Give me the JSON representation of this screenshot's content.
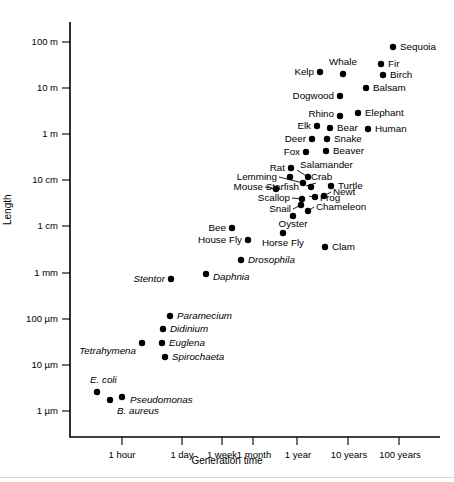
{
  "chart_data": {
    "type": "scatter",
    "title": "",
    "xlabel": "Generation time",
    "ylabel": "Length",
    "xscale": "log",
    "yscale": "log",
    "grid": false,
    "legend": "none",
    "x_tick_labels": [
      "1 hour",
      "1 day",
      "1 week",
      "1 month",
      "1 year",
      "10 years",
      "100 years"
    ],
    "y_tick_labels": [
      "100 m",
      "10 m",
      "1 m",
      "10 cm",
      "1 cm",
      "1 mm",
      "100 µm",
      "10 µm",
      "1 µm"
    ],
    "points": [
      {
        "label": "Sequoia",
        "generation_time": "100 years",
        "length": "100 m",
        "italic": false,
        "side": "right"
      },
      {
        "label": "Fir",
        "generation_time": "60 years",
        "length": "30 m",
        "italic": false,
        "side": "right"
      },
      {
        "label": "Birch",
        "generation_time": "60 years",
        "length": "20 m",
        "italic": false,
        "side": "right"
      },
      {
        "label": "Balsam",
        "generation_time": "30 years",
        "length": "12 m",
        "italic": false,
        "side": "right"
      },
      {
        "label": "Whale",
        "generation_time": "12 years",
        "length": "20 m",
        "italic": false,
        "side": "above"
      },
      {
        "label": "Kelp",
        "generation_time": "8 years",
        "length": "20 m",
        "italic": false,
        "side": "left"
      },
      {
        "label": "Dogwood",
        "generation_time": "12 years",
        "length": "8 m",
        "italic": false,
        "side": "left"
      },
      {
        "label": "Elephant",
        "generation_time": "20 years",
        "length": "3 m",
        "italic": false,
        "side": "right"
      },
      {
        "label": "Rhino",
        "generation_time": "12 years",
        "length": "3 m",
        "italic": false,
        "side": "left"
      },
      {
        "label": "Human",
        "generation_time": "25 years",
        "length": "1.8 m",
        "italic": false,
        "side": "right"
      },
      {
        "label": "Bear",
        "generation_time": "8 years",
        "length": "1.8 m",
        "italic": false,
        "side": "right"
      },
      {
        "label": "Elk",
        "generation_time": "6 years",
        "length": "1.8 m",
        "italic": false,
        "side": "left"
      },
      {
        "label": "Snake",
        "generation_time": "7 years",
        "length": "1.2 m",
        "italic": false,
        "side": "right"
      },
      {
        "label": "Deer",
        "generation_time": "5 years",
        "length": "1.2 m",
        "italic": false,
        "side": "left"
      },
      {
        "label": "Beaver",
        "generation_time": "6 years",
        "length": "0.8 m",
        "italic": false,
        "side": "right"
      },
      {
        "label": "Fox",
        "generation_time": "3.5 years",
        "length": "0.7 m",
        "italic": false,
        "side": "left"
      },
      {
        "label": "Salamander",
        "generation_time": "5 years",
        "length": "25 cm",
        "italic": false,
        "side": "right"
      },
      {
        "label": "Rat",
        "generation_time": "2.5 years",
        "length": "25 cm",
        "italic": false,
        "side": "left"
      },
      {
        "label": "Crab",
        "generation_time": "5 years",
        "length": "16 cm",
        "italic": false,
        "side": "right"
      },
      {
        "label": "Lemming",
        "generation_time": "2 years",
        "length": "14 cm",
        "italic": false,
        "side": "left"
      },
      {
        "label": "Turtle",
        "generation_time": "8 years",
        "length": "11 cm",
        "italic": false,
        "side": "right"
      },
      {
        "label": "Starfish",
        "generation_time": "4 years",
        "length": "11 cm",
        "italic": false,
        "side": "left"
      },
      {
        "label": "Mouse",
        "generation_time": "1 year",
        "length": "10 cm",
        "italic": false,
        "side": "left"
      },
      {
        "label": "Newt",
        "generation_time": "5 years",
        "length": "7 cm",
        "italic": false,
        "side": "right"
      },
      {
        "label": "Frog",
        "generation_time": "4.5 years",
        "length": "6.5 cm",
        "italic": false,
        "side": "right"
      },
      {
        "label": "Scallop",
        "generation_time": "3 years",
        "length": "6.5 cm",
        "italic": false,
        "side": "left"
      },
      {
        "label": "Chameleon",
        "generation_time": "4 years",
        "length": "4 cm",
        "italic": false,
        "side": "right"
      },
      {
        "label": "Snail",
        "generation_time": "2.5 years",
        "length": "4 cm",
        "italic": false,
        "side": "left"
      },
      {
        "label": "Oyster",
        "generation_time": "3 years",
        "length": "3 cm",
        "italic": false,
        "side": "below"
      },
      {
        "label": "Bee",
        "generation_time": "3 months",
        "length": "1.5 cm",
        "italic": false,
        "side": "left"
      },
      {
        "label": "Horse Fly",
        "generation_time": "1 year",
        "length": "1.3 cm",
        "italic": false,
        "side": "below"
      },
      {
        "label": "House Fly",
        "generation_time": "4 months",
        "length": "8 mm",
        "italic": false,
        "side": "left"
      },
      {
        "label": "Clam",
        "generation_time": "4 years",
        "length": "6 mm",
        "italic": false,
        "side": "right"
      },
      {
        "label": "Drosophila",
        "generation_time": "2 months",
        "length": "2.5 mm",
        "italic": true,
        "side": "right"
      },
      {
        "label": "Daphnia",
        "generation_time": "1 week",
        "length": "1.2 mm",
        "italic": true,
        "side": "right"
      },
      {
        "label": "Stentor",
        "generation_time": "3 days",
        "length": "1 mm",
        "italic": true,
        "side": "left"
      },
      {
        "label": "Paramecium",
        "generation_time": "1 day",
        "length": "200 µm",
        "italic": true,
        "side": "right"
      },
      {
        "label": "Didinium",
        "generation_time": "20 hours",
        "length": "100 µm",
        "italic": true,
        "side": "right"
      },
      {
        "label": "Tetrahymena",
        "generation_time": "6 hours",
        "length": "60 µm",
        "italic": true,
        "side": "left"
      },
      {
        "label": "Euglena",
        "generation_time": "20 hours",
        "length": "50 µm",
        "italic": true,
        "side": "right"
      },
      {
        "label": "Spirochaeta",
        "generation_time": "22 hours",
        "length": "22 µm",
        "italic": true,
        "side": "right"
      },
      {
        "label": "E. coli",
        "generation_time": "25 minutes",
        "length": "4 µm",
        "italic": true,
        "side": "above"
      },
      {
        "label": "B. aureus",
        "generation_time": "35 minutes",
        "length": "2.2 µm",
        "italic": true,
        "side": "below"
      },
      {
        "label": "Pseudomonas",
        "generation_time": "45 minutes",
        "length": "2.8 µm",
        "italic": true,
        "side": "right"
      }
    ]
  },
  "axes": {
    "y_label": "Length",
    "x_label": "Generation time"
  },
  "colors": {
    "point": "#000000",
    "axis": "#000000",
    "background": "#ffffff"
  }
}
